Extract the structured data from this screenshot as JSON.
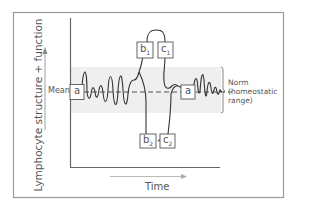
{
  "figure": {
    "y_axis_label": "Lymphocyte structure + function",
    "x_axis_label": "Time",
    "mean_label": "Mean",
    "norm_label_line1": "Norm",
    "norm_label_line2": "(homeostatic",
    "norm_label_line3": "range)",
    "boxes": {
      "a_left": "a",
      "a_right": "a",
      "b1": "b",
      "b1_sub": "1",
      "c1": "c",
      "c1_sub": "1",
      "b2": "b",
      "b2_sub": "2",
      "c2": "c",
      "c2_sub": "2"
    },
    "colors": {
      "frame": "#9a9a9a",
      "axis": "#555555",
      "norm_band": "#efefef",
      "curve": "#333333",
      "text": "#555555"
    }
  }
}
